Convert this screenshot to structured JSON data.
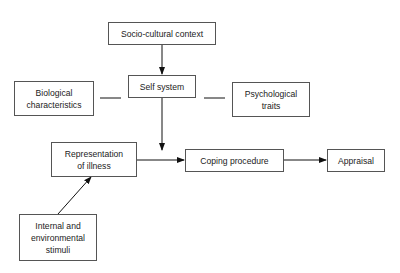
{
  "nodes": {
    "socio": "Socio-cultural context",
    "self": "Self system",
    "bio_1": "Biological",
    "bio_2": "characteristics",
    "psych_1": "Psychological",
    "psych_2": "traits",
    "rep_1": "Representation",
    "rep_2": "of illness",
    "coping": "Coping procedure",
    "appraisal": "Appraisal",
    "stim_1": "Internal and",
    "stim_2": "environmental",
    "stim_3": "stimuli"
  },
  "edges": [
    {
      "from": "socio",
      "to": "self",
      "type": "arrow"
    },
    {
      "from": "bio",
      "to": "self",
      "type": "line"
    },
    {
      "from": "self",
      "to": "psych",
      "type": "line"
    },
    {
      "from": "self",
      "to": "rep-coping-junction",
      "type": "arrow"
    },
    {
      "from": "rep",
      "to": "coping",
      "type": "arrow"
    },
    {
      "from": "coping",
      "to": "appraisal",
      "type": "arrow"
    },
    {
      "from": "stimuli",
      "to": "rep",
      "type": "arrow"
    }
  ]
}
